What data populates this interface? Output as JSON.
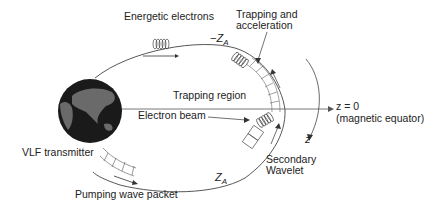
{
  "diagram": {
    "labels": {
      "energetic_electrons": "Energetic electrons",
      "trapping_and": "Trapping and",
      "acceleration": "acceleration",
      "minus_za": "−Z",
      "minus_za_sub": "A",
      "trapping_region": "Trapping region",
      "electron_beam": "Electron beam",
      "z_eq": "z = 0",
      "magnetic_equator": "(magnetic equator)",
      "z_axis": "z",
      "vlf_transmitter": "VLF transmitter",
      "secondary": "Secondary",
      "wavelet": "Wavelet",
      "za": "Z",
      "za_sub": "A",
      "pumping_wave_packet": "Pumping wave packet"
    },
    "colors": {
      "line": "#444444",
      "earth": "#1a1a1a",
      "land": "#6a6a6a"
    }
  }
}
